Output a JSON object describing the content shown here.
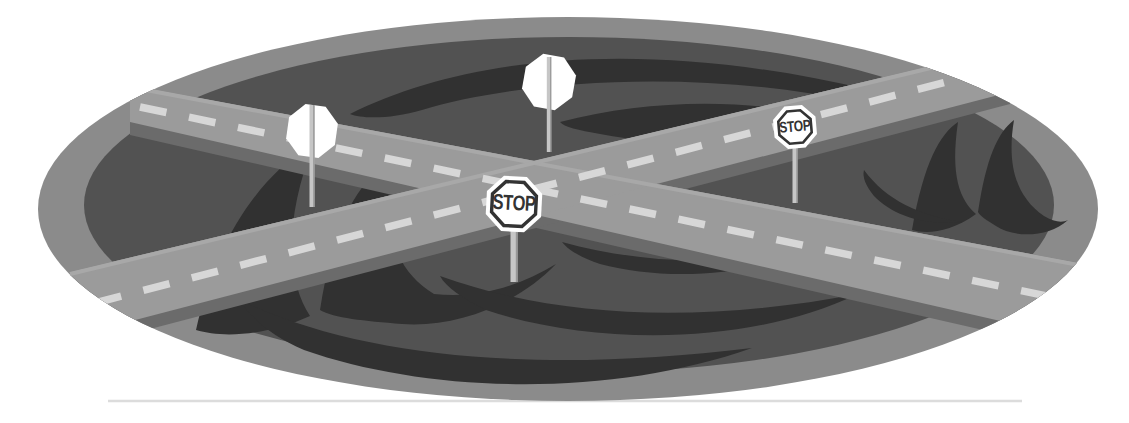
{
  "signs": {
    "center_stop": {
      "label": "STOP"
    },
    "right_stop": {
      "label": "STOP"
    }
  },
  "colors": {
    "background": "#ffffff",
    "field_rim": "#8b8b8b",
    "field_inner": "#525252",
    "swoosh": "#313131",
    "road_surface": "#9b9b9b",
    "road_edge_shadow": "#6b6b6b",
    "road_edge_highlight": "#a8a8a8",
    "lane_dash": "#d7d7d7",
    "sign_face": "#ffffff",
    "sign_ink": "#333333",
    "sign_pole": "#c6c6c6",
    "pole_shade": "#979797",
    "ground_line": "#dcdcdc"
  }
}
